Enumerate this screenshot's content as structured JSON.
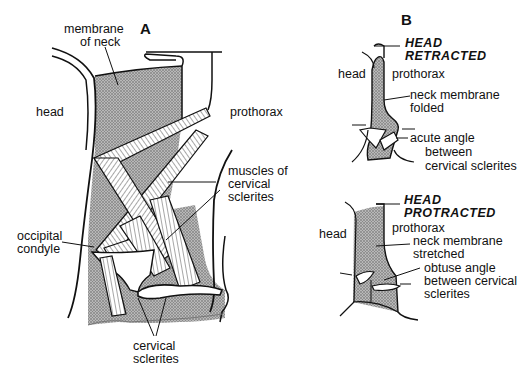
{
  "panel_a": {
    "letter": "A",
    "labels": {
      "membrane_of_neck": [
        "membrane",
        "of neck"
      ],
      "head": "head",
      "prothorax": "prothorax",
      "muscles": [
        "muscles of",
        "cervical",
        "sclerites"
      ],
      "occipital_condyle": [
        "occipital",
        "condyle"
      ],
      "cervical_sclerites": [
        "cervical",
        "sclerites"
      ]
    }
  },
  "panel_b": {
    "letter": "B",
    "retracted": {
      "state": [
        "HEAD",
        "RETRACTED"
      ],
      "head": "head",
      "prothorax": "prothorax",
      "membrane": [
        "neck membrane",
        "folded"
      ],
      "angle": [
        "acute angle",
        "between",
        "cervical sclerites"
      ]
    },
    "protracted": {
      "state": [
        "HEAD",
        "PROTRACTED"
      ],
      "head": "head",
      "prothorax": "prothorax",
      "membrane": [
        "neck membrane",
        "stretched"
      ],
      "angle": [
        "obtuse angle",
        "between cervical",
        "sclerites"
      ]
    }
  },
  "colors": {
    "ink": "#111111",
    "membrane_fill": "#9a9a9a",
    "background": "#ffffff"
  }
}
